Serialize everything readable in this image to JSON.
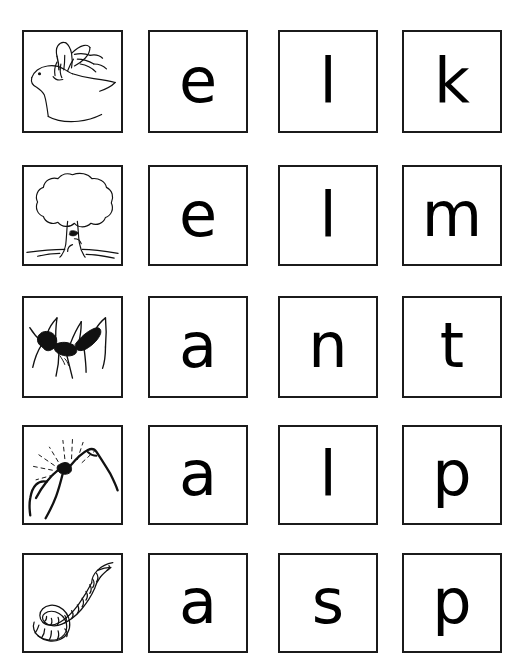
{
  "worksheet": {
    "title": "Phonics picture-and-letter matching worksheet",
    "background_color": "#ffffff",
    "ink_color": "#000000",
    "border_color": "#1b1b1b",
    "columns": 4,
    "rows": 5,
    "column_roles": [
      "picture",
      "letter-1",
      "letter-2",
      "letter-3"
    ]
  },
  "rows": [
    {
      "id": "row-1",
      "word": "elk",
      "picture": "elk-illustration",
      "picture_label": "elk head with antlers",
      "letters": [
        "e",
        "l",
        "k"
      ]
    },
    {
      "id": "row-2",
      "word": "elm",
      "picture": "elm-tree-illustration",
      "picture_label": "elm tree",
      "letters": [
        "e",
        "l",
        "m"
      ]
    },
    {
      "id": "row-3",
      "word": "ant",
      "picture": "ant-illustration",
      "picture_label": "ant",
      "letters": [
        "a",
        "n",
        "t"
      ]
    },
    {
      "id": "row-4",
      "word": "alp",
      "picture": "alp-illustration",
      "picture_label": "mountain peak with sun rays",
      "letters": [
        "a",
        "l",
        "p"
      ]
    },
    {
      "id": "row-5",
      "word": "asp",
      "picture": "asp-illustration",
      "picture_label": "coiled asp snake",
      "letters": [
        "a",
        "s",
        "p"
      ]
    }
  ]
}
